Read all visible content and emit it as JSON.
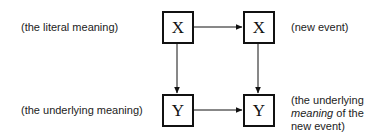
{
  "nodes": {
    "top_left": {
      "symbol": "X"
    },
    "top_right": {
      "symbol": "X"
    },
    "bottom_left": {
      "symbol": "Y"
    },
    "bottom_right": {
      "symbol": "Y"
    }
  },
  "labels": {
    "literal": "(the literal meaning)",
    "new_event": "(new event)",
    "underlying": "(the underlying meaning)",
    "underlying_new_line1": "(the underlying",
    "underlying_new_line2_em": "meaning",
    "underlying_new_line2_rest": " of the",
    "underlying_new_line3": "new event)"
  },
  "edges": [
    {
      "from": "top_left",
      "to": "top_right"
    },
    {
      "from": "top_left",
      "to": "bottom_left"
    },
    {
      "from": "top_right",
      "to": "bottom_right"
    },
    {
      "from": "bottom_left",
      "to": "bottom_right"
    }
  ]
}
